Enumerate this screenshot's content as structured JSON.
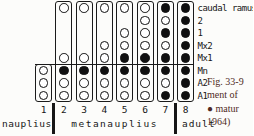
{
  "figure": {
    "caption": {
      "lines": [
        "Fig. 33-9",
        "ment of",
        "● matur",
        "1964)"
      ],
      "color": "#4f2a23"
    },
    "ink_color": "#161616"
  },
  "chart_data": {
    "type": "heatmap",
    "x": [
      "1",
      "2",
      "3",
      "4",
      "5",
      "6",
      "7",
      "8"
    ],
    "y": [
      "caudal ramus",
      "2",
      "1",
      "Mx2",
      "Mx1",
      "Mn",
      "A2",
      "A1"
    ],
    "x_groups": [
      {
        "label": "nauplius",
        "cols": [
          0,
          0
        ]
      },
      {
        "label": "metanauplius",
        "cols": [
          1,
          6
        ]
      },
      {
        "label": "adult",
        "cols": [
          7,
          7
        ]
      }
    ],
    "marker_legend": {
      "mature": "filled circle",
      "immature": "open circle"
    },
    "column_box_row_span": [
      [
        5,
        7
      ],
      [
        0,
        7
      ],
      [
        0,
        7
      ],
      [
        0,
        7
      ],
      [
        0,
        7
      ],
      [
        0,
        7
      ],
      [
        0,
        7
      ],
      [
        0,
        7
      ]
    ],
    "cells": [
      [
        null,
        "immature",
        "immature",
        "immature",
        "immature",
        "immature",
        "mature",
        "mature"
      ],
      [
        null,
        null,
        null,
        null,
        null,
        "immature",
        "immature",
        "mature"
      ],
      [
        null,
        null,
        null,
        null,
        "immature",
        "immature",
        "mature",
        "mature"
      ],
      [
        null,
        null,
        null,
        "immature",
        "immature",
        "immature",
        "immature",
        "mature"
      ],
      [
        null,
        "immature",
        "immature",
        "immature",
        "mature",
        "mature",
        "mature",
        "mature"
      ],
      [
        "immature",
        "mature",
        "mature",
        "mature",
        "mature",
        "mature",
        "mature",
        "mature"
      ],
      [
        "immature",
        "immature",
        "immature",
        "immature",
        "immature",
        "immature",
        "immature",
        "mature"
      ],
      [
        "immature",
        "immature",
        "immature",
        "immature",
        "immature",
        "immature",
        "mature",
        "mature"
      ]
    ],
    "grid": false,
    "legend_position": "none"
  }
}
